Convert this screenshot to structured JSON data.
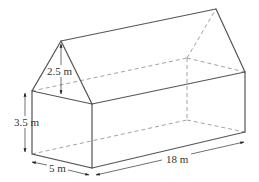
{
  "diagram": {
    "labels": {
      "roof_height": "2.5 m",
      "wall_height": "3.5 m",
      "width": "5 m",
      "length": "18 m"
    },
    "colors": {
      "edge": "#555555",
      "hidden_edge": "#8a8a8a",
      "text": "#333333",
      "background": "#ffffff"
    }
  }
}
